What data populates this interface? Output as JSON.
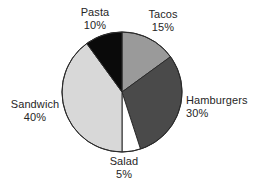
{
  "chart_data": {
    "type": "pie",
    "title": "",
    "subtitle": "",
    "xlabel": "",
    "ylabel": "",
    "legend_position": "none",
    "grid": false,
    "units": "percent",
    "total": 100,
    "start_angle_deg": 0,
    "direction": "clockwise",
    "categories": [
      "Tacos",
      "Hamburgers",
      "Salad",
      "Sandwich",
      "Pasta"
    ],
    "values": [
      15,
      30,
      5,
      40,
      10
    ],
    "slices": [
      {
        "label": "Tacos",
        "percent_text": "15%",
        "value": 15,
        "color": "#9a9a9a",
        "start_deg": 0,
        "end_deg": 54
      },
      {
        "label": "Hamburgers",
        "percent_text": "30%",
        "value": 30,
        "color": "#4a4a4a",
        "start_deg": 54,
        "end_deg": 162
      },
      {
        "label": "Salad",
        "percent_text": "5%",
        "value": 5,
        "color": "#ffffff",
        "start_deg": 162,
        "end_deg": 180
      },
      {
        "label": "Sandwich",
        "percent_text": "40%",
        "value": 40,
        "color": "#d8d8d8",
        "start_deg": 180,
        "end_deg": 324
      },
      {
        "label": "Pasta",
        "percent_text": "10%",
        "value": 10,
        "color": "#0a0a0a",
        "start_deg": 324,
        "end_deg": 360
      }
    ],
    "outline_color": "#2b2b2b",
    "background_color": "#ffffff"
  },
  "labels": {
    "pasta": {
      "name": "Pasta",
      "percent": "10%"
    },
    "tacos": {
      "name": "Tacos",
      "percent": "15%"
    },
    "hamburgers": {
      "name": "Hamburgers",
      "percent": "30%"
    },
    "sandwich": {
      "name": "Sandwich",
      "percent": "40%"
    },
    "salad": {
      "name": "Salad",
      "percent": "5%"
    }
  }
}
